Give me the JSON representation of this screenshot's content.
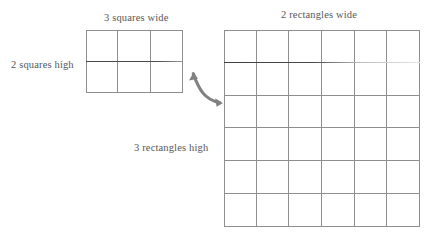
{
  "figure": {
    "background_color": "#ffffff",
    "line_color": "#8e8e8e",
    "accent_line_color": "#4a4a4a",
    "text_color": "#575757"
  },
  "labels": {
    "squares_wide": "3 squares wide",
    "squares_high": "2 squares high",
    "rectangles_wide": "2 rectangles wide",
    "rectangles_high": "3 rectangles high"
  },
  "grids": {
    "squares": {
      "name": "squares-grid",
      "columns": 3,
      "rows": 2,
      "cells": 6
    },
    "rectangles": {
      "name": "rectangles-grid",
      "columns": 6,
      "rows": 6,
      "cells": 36
    }
  },
  "arrow": {
    "name": "curved-transform-arrow",
    "color": "#808080",
    "direction": "left-to-right"
  }
}
